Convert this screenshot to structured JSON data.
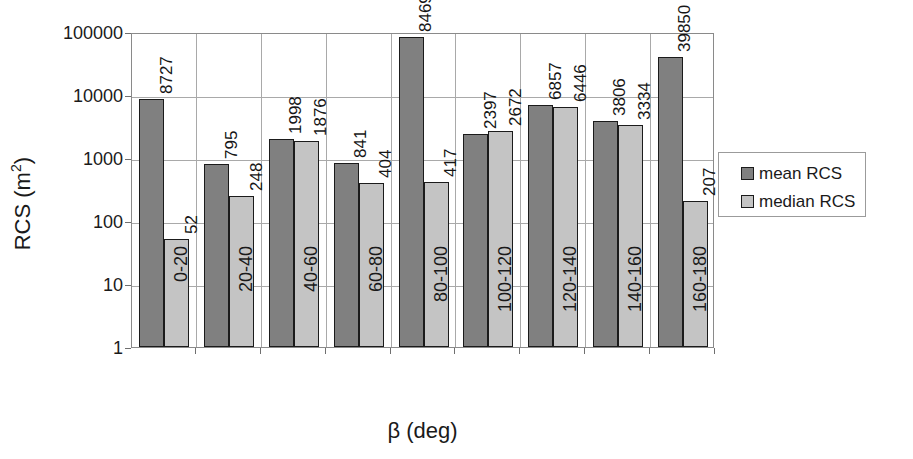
{
  "chart_data": {
    "type": "bar",
    "title": "",
    "xlabel": "β (deg)",
    "ylabel": "RCS (m²)",
    "ylabel_base": "RCS (m",
    "ylabel_exponent": "2",
    "ylabel_close": ")",
    "yscale": "log",
    "ylim": [
      1,
      100000
    ],
    "ytick_labels": [
      "100000",
      "10000",
      "1000",
      "100",
      "10",
      "1"
    ],
    "ytick_values": [
      100000,
      10000,
      1000,
      100,
      10,
      1
    ],
    "grid": true,
    "legend_position": "right",
    "categories": [
      "0-20",
      "20-40",
      "40-60",
      "60-80",
      "80-100",
      "100-120",
      "120-140",
      "140-160",
      "160-180"
    ],
    "series": [
      {
        "name": "mean RCS",
        "color": "#808080",
        "values": [
          8727,
          795,
          1998,
          841,
          84697,
          2397,
          6857,
          3806,
          39850
        ],
        "labels": [
          "8727",
          "795",
          "1998",
          "841",
          "84697",
          "2397",
          "6857",
          "3806",
          "39850"
        ]
      },
      {
        "name": "median RCS",
        "color": "#c4c4c4",
        "values": [
          52,
          248,
          1876,
          404,
          417,
          2672,
          6446,
          3334,
          207
        ],
        "labels": [
          "52",
          "248",
          "1876",
          "404",
          "417",
          "2672",
          "6446",
          "3334",
          "207"
        ]
      }
    ]
  },
  "legend": {
    "items": [
      {
        "label": "mean RCS",
        "swatch": "mean"
      },
      {
        "label": "median RCS",
        "swatch": "median"
      }
    ]
  },
  "axes": {
    "x_title": "β (deg)",
    "y_title_base": "RCS (m",
    "y_title_sup": "2",
    "y_title_tail": ")"
  }
}
